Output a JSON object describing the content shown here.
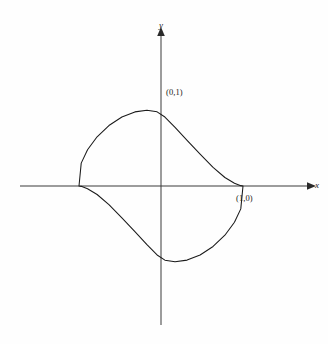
{
  "figure": {
    "background_color": "#fefefe",
    "stroke_color": "#1a1a1a",
    "axis_color": "#3a3a3a"
  },
  "labels": {
    "y_axis": "y",
    "x_axis": "x",
    "point_top": "(0,1)",
    "point_right": "(1,0)"
  },
  "chart_data": {
    "type": "line",
    "title": "",
    "subtitle": "",
    "xlabel": "x",
    "ylabel": "y",
    "grid": false,
    "legend": null,
    "curve_name": "astroid",
    "equation": "x^(2/3) + y^(2/3) = 1",
    "parametric": {
      "x": "cos^3(t)",
      "y": "sin^3(t)",
      "t_range": [
        0,
        6.283185307179586
      ]
    },
    "xlim": [
      -1.72,
      1.82
    ],
    "ylim": [
      -1.75,
      1.95
    ],
    "axis_origin_px": [
      161,
      186
    ],
    "unit_px": {
      "x": 82,
      "y": 79
    },
    "annotations": [
      {
        "text": "(0,1)",
        "x": 0,
        "y": 1,
        "anchor": "right-of-cusp"
      },
      {
        "text": "(1,0)",
        "x": 1,
        "y": 0,
        "anchor": "below-right-of-cusp"
      }
    ],
    "cusps": [
      {
        "x": 1,
        "y": 0
      },
      {
        "x": 0,
        "y": 1
      },
      {
        "x": -1,
        "y": 0
      },
      {
        "x": 0,
        "y": -1
      }
    ],
    "x": [
      1.0,
      0.9729,
      0.8958,
      0.7791,
      0.635,
      0.4769,
      0.3182,
      0.1715,
      0.0477,
      -0.0477,
      -0.1715,
      -0.3182,
      -0.4769,
      -0.635,
      -0.7791,
      -0.8958,
      -0.9729,
      -1.0,
      -0.9729,
      -0.8958,
      -0.7791,
      -0.635,
      -0.4769,
      -0.3182,
      -0.1715,
      -0.0477,
      0.0477,
      0.1715,
      0.3182,
      0.4769,
      0.635,
      0.7791,
      0.8958,
      0.9729,
      1.0
    ],
    "y": [
      0.0,
      0.0045,
      0.0341,
      0.1073,
      0.2346,
      0.4045,
      0.5785,
      0.7421,
      0.8729,
      0.9388,
      0.9587,
      0.9381,
      0.8727,
      0.7651,
      0.6226,
      0.4584,
      0.2897,
      0.0,
      -0.0045,
      -0.0341,
      -0.1073,
      -0.2346,
      -0.4045,
      -0.5785,
      -0.7421,
      -0.8729,
      -0.9388,
      -0.9587,
      -0.9381,
      -0.8727,
      -0.7651,
      -0.6226,
      -0.4584,
      -0.2897,
      0.0
    ]
  }
}
